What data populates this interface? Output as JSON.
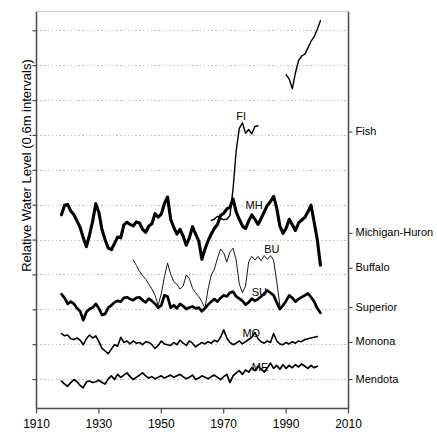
{
  "chart_data": {
    "type": "line",
    "title": "",
    "xlabel": "",
    "ylabel": "Relative Water Level (0.6m intervals)",
    "xlim": [
      1910,
      2010
    ],
    "xticks": [
      1910,
      1930,
      1950,
      1970,
      1990,
      2010
    ],
    "xticklabels": [
      "1910",
      "1930",
      "1950",
      "1970",
      "1990",
      "2010"
    ],
    "yticklabels": [],
    "ylim": [
      0,
      10.7
    ],
    "y_unit_note": "vertical axis in arbitrary offset units; dotted gridlines every 0.6 m",
    "grid": true,
    "grid_style": "dotted-horizontal",
    "legend": "right-side inline labels",
    "right_labels": [
      {
        "name": "fish-right-label",
        "text": "Fish",
        "y_value": 7.45
      },
      {
        "name": "michigan-huron-right-label",
        "text": "Michigan-Huron",
        "y_value": 4.72
      },
      {
        "name": "buffalo-right-label",
        "text": "Buffalo",
        "y_value": 3.78
      },
      {
        "name": "superior-right-label",
        "text": "Superior",
        "y_value": 2.72
      },
      {
        "name": "monona-right-label",
        "text": "Monona",
        "y_value": 1.78
      },
      {
        "name": "mendota-right-label",
        "text": "Mendota",
        "y_value": 0.78
      }
    ],
    "inline_labels": [
      {
        "text": "FI",
        "x": 1974,
        "y": 7.85
      },
      {
        "text": "MH",
        "x": 1977,
        "y": 5.45
      },
      {
        "text": "BU",
        "x": 1983,
        "y": 4.28
      },
      {
        "text": "SU",
        "x": 1979,
        "y": 3.12
      },
      {
        "text": "MO",
        "x": 1976,
        "y": 2.02
      },
      {
        "text": "ME",
        "x": 1979,
        "y": 1.1
      }
    ],
    "series": [
      {
        "name": "Fish",
        "code": "FI",
        "style": "thin-black",
        "linewidth": 1.4,
        "segments": [
          {
            "comment": "early Fish Lake record 1966-1981",
            "x": [
              1966,
              1967,
              1968,
              1969,
              1970,
              1971,
              1972,
              1973,
              1974,
              1975,
              1976,
              1977,
              1978,
              1979,
              1980,
              1981
            ],
            "y": [
              5.07,
              5.1,
              5.18,
              5.12,
              5.09,
              5.1,
              5.2,
              5.92,
              6.95,
              7.55,
              7.7,
              7.42,
              7.52,
              7.4,
              7.6,
              7.62
            ]
          },
          {
            "comment": "later Fish Lake record 1990-2001",
            "x": [
              1990,
              1991,
              1992,
              1993,
              1994,
              1995,
              1996,
              1997,
              1998,
              1999,
              2000,
              2001
            ],
            "y": [
              9.0,
              8.88,
              8.62,
              9.05,
              9.38,
              9.5,
              9.55,
              9.72,
              9.9,
              10.02,
              10.22,
              10.45
            ]
          }
        ]
      },
      {
        "name": "Michigan-Huron",
        "code": "MH",
        "style": "thick-black",
        "linewidth": 3.1,
        "segments": [
          {
            "x": [
              1918,
              1919,
              1920,
              1921,
              1922,
              1923,
              1924,
              1925,
              1926,
              1927,
              1928,
              1929,
              1930,
              1931,
              1932,
              1933,
              1934,
              1935,
              1936,
              1937,
              1938,
              1939,
              1940,
              1941,
              1942,
              1943,
              1944,
              1945,
              1946,
              1947,
              1948,
              1949,
              1950,
              1951,
              1952,
              1953,
              1954,
              1955,
              1956,
              1957,
              1958,
              1959,
              1960,
              1961,
              1962,
              1963,
              1964,
              1965,
              1966,
              1967,
              1968,
              1969,
              1970,
              1971,
              1972,
              1973,
              1974,
              1975,
              1976,
              1977,
              1978,
              1979,
              1980,
              1981,
              1982,
              1983,
              1984,
              1985,
              1986,
              1987,
              1988,
              1989,
              1990,
              1991,
              1992,
              1993,
              1994,
              1995,
              1996,
              1997,
              1998,
              1999,
              2000,
              2001
            ],
            "y": [
              5.22,
              5.48,
              5.5,
              5.32,
              5.22,
              5.05,
              4.88,
              4.6,
              4.36,
              4.68,
              5.05,
              5.52,
              5.28,
              4.82,
              4.55,
              4.32,
              4.28,
              4.45,
              4.62,
              4.6,
              4.95,
              5.02,
              4.96,
              4.92,
              5.03,
              5.0,
              4.83,
              4.75,
              4.92,
              4.98,
              5.25,
              5.16,
              5.24,
              5.52,
              5.7,
              5.1,
              4.88,
              4.7,
              4.83,
              4.65,
              4.4,
              4.6,
              4.9,
              4.7,
              4.52,
              4.02,
              4.3,
              4.52,
              4.7,
              4.85,
              4.96,
              5.2,
              5.26,
              5.38,
              5.42,
              5.65,
              5.3,
              5.1,
              4.92,
              4.85,
              5.05,
              5.22,
              5.1,
              4.96,
              5.12,
              5.3,
              5.48,
              5.58,
              5.72,
              5.4,
              4.92,
              4.72,
              4.86,
              5.1,
              4.95,
              4.8,
              5.0,
              5.08,
              5.15,
              5.3,
              5.48,
              5.02,
              4.55,
              3.86
            ]
          }
        ]
      },
      {
        "name": "Buffalo",
        "code": "BU",
        "style": "hairline-black",
        "linewidth": 0.9,
        "segments": [
          {
            "x": [
              1941,
              1942,
              1943,
              1944,
              1945,
              1946,
              1947,
              1948,
              1949,
              1950,
              1951,
              1952,
              1953,
              1954,
              1955,
              1956,
              1957,
              1958,
              1959,
              1960,
              1961,
              1962,
              1963,
              1964,
              1965,
              1966,
              1967,
              1968,
              1969,
              1970,
              1971,
              1972,
              1973,
              1974,
              1975,
              1976,
              1977,
              1978,
              1979,
              1980,
              1981,
              1982,
              1983,
              1984,
              1985,
              1986,
              1987,
              1988
            ],
            "y": [
              4.0,
              3.86,
              3.7,
              3.58,
              3.48,
              3.35,
              3.22,
              3.05,
              2.78,
              3.1,
              3.55,
              3.92,
              3.62,
              3.42,
              3.35,
              3.22,
              3.3,
              3.6,
              3.5,
              3.24,
              3.12,
              3.02,
              2.88,
              2.7,
              3.22,
              3.6,
              3.75,
              4.05,
              4.3,
              4.2,
              3.95,
              4.22,
              4.32,
              4.0,
              3.35,
              3.12,
              3.3,
              3.95,
              4.1,
              4.0,
              4.1,
              3.98,
              4.12,
              4.02,
              4.12,
              4.0,
              3.42,
              2.78
            ]
          }
        ]
      },
      {
        "name": "Superior",
        "code": "SU",
        "style": "thick-black",
        "linewidth": 2.7,
        "segments": [
          {
            "x": [
              1918,
              1919,
              1920,
              1921,
              1922,
              1923,
              1924,
              1925,
              1926,
              1927,
              1928,
              1929,
              1930,
              1931,
              1932,
              1933,
              1934,
              1935,
              1936,
              1937,
              1938,
              1939,
              1940,
              1941,
              1942,
              1943,
              1944,
              1945,
              1946,
              1947,
              1948,
              1949,
              1950,
              1951,
              1952,
              1953,
              1954,
              1955,
              1956,
              1957,
              1958,
              1959,
              1960,
              1961,
              1962,
              1963,
              1964,
              1965,
              1966,
              1967,
              1968,
              1969,
              1970,
              1971,
              1972,
              1973,
              1974,
              1975,
              1976,
              1977,
              1978,
              1979,
              1980,
              1981,
              1982,
              1983,
              1984,
              1985,
              1986,
              1987,
              1988,
              1989,
              1990,
              1991,
              1992,
              1993,
              1994,
              1995,
              1996,
              1997,
              1998,
              1999,
              2000,
              2001
            ],
            "y": [
              3.08,
              2.98,
              2.82,
              2.88,
              2.82,
              2.7,
              2.62,
              2.38,
              2.6,
              2.68,
              2.72,
              2.82,
              2.7,
              2.52,
              2.55,
              2.72,
              2.78,
              2.86,
              2.9,
              2.88,
              2.98,
              3.0,
              2.95,
              2.92,
              2.98,
              3.0,
              2.92,
              2.86,
              2.96,
              2.9,
              2.82,
              2.72,
              2.78,
              3.05,
              3.02,
              2.72,
              2.78,
              2.7,
              2.82,
              2.76,
              2.68,
              2.72,
              2.75,
              2.7,
              2.72,
              2.62,
              2.7,
              2.8,
              2.88,
              2.95,
              2.88,
              2.98,
              3.05,
              3.02,
              3.12,
              3.15,
              3.02,
              2.96,
              2.9,
              2.8,
              2.86,
              2.96,
              2.9,
              2.95,
              3.02,
              3.1,
              3.18,
              3.12,
              3.05,
              2.86,
              2.68,
              2.78,
              2.9,
              3.05,
              2.98,
              2.88,
              2.95,
              3.0,
              3.05,
              3.1,
              3.0,
              2.88,
              2.7,
              2.58
            ]
          }
        ]
      },
      {
        "name": "Monona",
        "code": "MO",
        "style": "medium-black",
        "linewidth": 1.6,
        "segments": [
          {
            "x": [
              1918,
              1919,
              1920,
              1921,
              1922,
              1923,
              1924,
              1925,
              1926,
              1927,
              1928,
              1929,
              1930,
              1931,
              1932,
              1933,
              1934,
              1935,
              1936,
              1937,
              1938,
              1939,
              1940,
              1941,
              1942,
              1943,
              1944,
              1945,
              1946,
              1947,
              1948,
              1949,
              1950,
              1951,
              1952,
              1953,
              1954,
              1955,
              1956,
              1957,
              1958,
              1959,
              1960,
              1961,
              1962,
              1963,
              1964,
              1965,
              1966,
              1967,
              1968,
              1969,
              1970,
              1971,
              1972,
              1973,
              1974,
              1975,
              1976,
              1977,
              1978,
              1979,
              1980,
              1981,
              1982,
              1983,
              1984,
              1985,
              1986,
              1987,
              1988,
              1989,
              1990,
              1991,
              1992,
              1993,
              1994,
              1995,
              1996,
              1997,
              1998,
              1999,
              2000
            ],
            "y": [
              2.02,
              1.96,
              1.98,
              1.88,
              1.86,
              1.9,
              1.84,
              1.72,
              1.88,
              1.98,
              1.9,
              1.96,
              1.8,
              1.62,
              1.55,
              1.48,
              1.6,
              1.72,
              1.68,
              1.92,
              1.78,
              1.82,
              1.74,
              1.82,
              1.76,
              1.78,
              1.72,
              1.8,
              1.78,
              1.72,
              1.62,
              1.7,
              1.82,
              1.74,
              1.72,
              1.7,
              1.78,
              1.72,
              1.84,
              1.76,
              1.7,
              1.82,
              1.76,
              1.66,
              1.72,
              1.78,
              1.74,
              1.8,
              1.76,
              1.84,
              1.8,
              1.92,
              2.12,
              1.9,
              1.78,
              1.72,
              1.76,
              1.82,
              1.74,
              1.8,
              1.86,
              1.92,
              2.05,
              1.88,
              1.8,
              1.76,
              1.82,
              1.78,
              2.02,
              1.82,
              1.74,
              1.72,
              1.78,
              1.74,
              1.8,
              1.76,
              1.82,
              1.8,
              1.86,
              1.88,
              1.9,
              1.92,
              1.94
            ]
          }
        ]
      },
      {
        "name": "Mendota",
        "code": "ME",
        "style": "medium-black",
        "linewidth": 1.7,
        "segments": [
          {
            "x": [
              1918,
              1919,
              1920,
              1921,
              1922,
              1923,
              1924,
              1925,
              1926,
              1927,
              1928,
              1929,
              1930,
              1931,
              1932,
              1933,
              1934,
              1935,
              1936,
              1937,
              1938,
              1939,
              1940,
              1941,
              1942,
              1943,
              1944,
              1945,
              1946,
              1947,
              1948,
              1949,
              1950,
              1951,
              1952,
              1953,
              1954,
              1955,
              1956,
              1957,
              1958,
              1959,
              1960,
              1961,
              1962,
              1963,
              1964,
              1965,
              1966,
              1967,
              1968,
              1969,
              1970,
              1971,
              1972,
              1973,
              1974,
              1975,
              1976,
              1977,
              1978,
              1979,
              1980,
              1981,
              1982,
              1983,
              1984,
              1985,
              1986,
              1987,
              1988,
              1989,
              1990,
              1991,
              1992,
              1993,
              1994,
              1995,
              1996,
              1997,
              1998,
              1999,
              2000
            ],
            "y": [
              0.74,
              0.66,
              0.6,
              0.7,
              0.78,
              0.72,
              0.62,
              0.56,
              0.72,
              0.74,
              0.7,
              0.72,
              0.76,
              0.7,
              0.66,
              0.8,
              0.88,
              0.78,
              0.92,
              0.84,
              0.9,
              0.96,
              0.86,
              0.78,
              0.84,
              0.9,
              0.96,
              0.88,
              0.82,
              0.86,
              0.8,
              0.84,
              0.88,
              0.82,
              0.86,
              0.9,
              0.84,
              0.88,
              0.92,
              0.86,
              0.8,
              0.84,
              0.9,
              0.78,
              0.82,
              0.88,
              0.84,
              0.8,
              0.86,
              0.9,
              0.84,
              0.78,
              0.86,
              0.92,
              0.7,
              0.88,
              0.96,
              1.02,
              0.92,
              1.04,
              0.98,
              1.1,
              1.02,
              1.14,
              1.06,
              0.98,
              1.1,
              1.22,
              1.08,
              1.16,
              1.06,
              1.18,
              1.08,
              1.16,
              1.1,
              1.18,
              1.12,
              1.2,
              1.14,
              1.08,
              1.16,
              1.1,
              1.14
            ]
          }
        ]
      }
    ]
  }
}
